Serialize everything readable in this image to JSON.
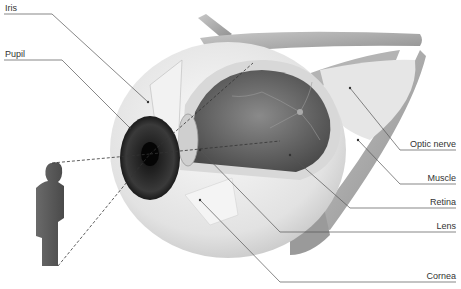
{
  "diagram": {
    "labels_left": [
      {
        "id": "iris",
        "text": "Iris"
      },
      {
        "id": "pupil",
        "text": "Pupil"
      }
    ],
    "labels_right": [
      {
        "id": "optic-nerve",
        "text": "Optic nerve"
      },
      {
        "id": "muscle",
        "text": "Muscle"
      },
      {
        "id": "retina",
        "text": "Retina"
      },
      {
        "id": "lens",
        "text": "Lens"
      },
      {
        "id": "cornea",
        "text": "Cornea"
      }
    ],
    "colors": {
      "background": "#ffffff",
      "leader_line": "#555555",
      "sclera": "#e8e8e8",
      "muscle": "#a8a8a8",
      "interior": "#6e6e6e",
      "iris": "#2a2a2a",
      "figure": "#5a5a5a"
    }
  }
}
